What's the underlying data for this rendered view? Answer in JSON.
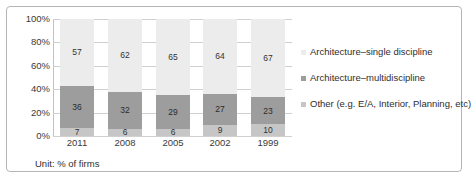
{
  "chart_data": {
    "type": "bar",
    "subtype": "100% stacked column",
    "title": "",
    "xlabel": "",
    "ylabel": "",
    "ylim": [
      0,
      100
    ],
    "ytick_labels": [
      "100%",
      "80%",
      "60%",
      "40%",
      "20%",
      "0%"
    ],
    "ytick_values": [
      100,
      80,
      60,
      40,
      20,
      0
    ],
    "grid": true,
    "legend_position": "right",
    "unit_note": "Unit: % of firms",
    "categories": [
      "2011",
      "2008",
      "2005",
      "2002",
      "1999"
    ],
    "series": [
      {
        "name": "Other (e.g. E/A, Interior, Planning, etc)",
        "color": "#c6c6c6",
        "stack_order": 0,
        "values": [
          7,
          6,
          6,
          9,
          10
        ]
      },
      {
        "name": "Architecture–multidiscipline",
        "color": "#9d9d9d",
        "stack_order": 1,
        "values": [
          36,
          32,
          29,
          27,
          23
        ]
      },
      {
        "name": "Architecture–single discipline",
        "color": "#ececec",
        "stack_order": 2,
        "values": [
          57,
          62,
          65,
          64,
          67
        ]
      }
    ]
  },
  "legend": {
    "items": [
      {
        "label": "Architecture–single discipline",
        "color": "#ececec"
      },
      {
        "label": "Architecture–multidiscipline",
        "color": "#9d9d9d"
      },
      {
        "label": "Other (e.g. E/A, Interior, Planning, etc)",
        "color": "#c6c6c6"
      }
    ]
  },
  "footer": {
    "unit": "Unit: % of firms"
  }
}
